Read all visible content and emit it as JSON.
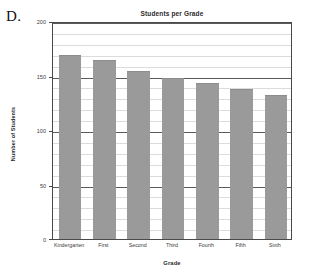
{
  "panel": {
    "letter": "D."
  },
  "chart_data": {
    "type": "bar",
    "title": "Students per Grade",
    "xlabel": "Grade",
    "ylabel": "Number of Students",
    "categories": [
      "Kindergarten",
      "First",
      "Second",
      "Third",
      "Fourth",
      "Fifth",
      "Sixth"
    ],
    "values": [
      169,
      164,
      154,
      148,
      143,
      138,
      132
    ],
    "ylim": [
      0,
      200
    ],
    "xlim": [
      0,
      7
    ],
    "y_ticks": [
      0,
      50,
      100,
      150,
      200
    ],
    "y_tick_labels": [
      "0",
      "50",
      "100",
      "150",
      "200"
    ],
    "y_minor_tick_step": 10,
    "grid": true,
    "grid_axis": "y",
    "legend": false,
    "bar_color": "#9a9a9a",
    "axis_color": "#4a4a4a",
    "major_grid_color": "#5a5a5a",
    "minor_grid_color": "#dcdcdc",
    "background": "#ffffff"
  }
}
